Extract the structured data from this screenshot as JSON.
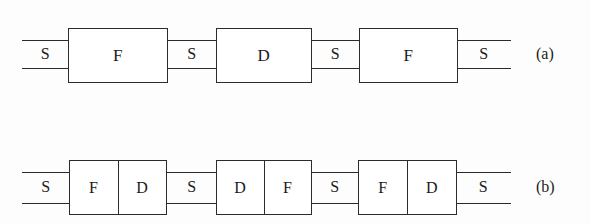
{
  "figure": {
    "background_color": "#fdfdfd",
    "ink_color": "#2b2b2b",
    "panels": [
      {
        "caption": "(a)",
        "segment_labels": [
          "S",
          "S",
          "S",
          "S"
        ],
        "blocks": [
          {
            "label": "F",
            "kind": "single"
          },
          {
            "label": "D",
            "kind": "single"
          },
          {
            "label": "F",
            "kind": "single"
          }
        ]
      },
      {
        "caption": "(b)",
        "segment_labels": [
          "S",
          "S",
          "S",
          "S"
        ],
        "blocks": [
          {
            "kind": "pair",
            "left_label": "F",
            "right_label": "D"
          },
          {
            "kind": "pair",
            "left_label": "D",
            "right_label": "F"
          },
          {
            "kind": "pair",
            "left_label": "F",
            "right_label": "D"
          }
        ]
      }
    ]
  }
}
